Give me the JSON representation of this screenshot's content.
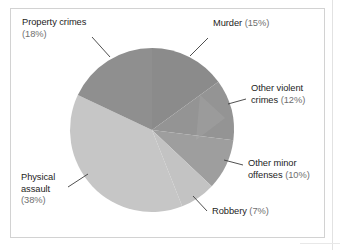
{
  "figure": {
    "background_color": "#ffffff",
    "frame_color": "#d2d2d2"
  },
  "chart_data": {
    "type": "pie",
    "title": "",
    "subtitle": "",
    "xlabel": "",
    "ylabel": "",
    "legend_position": "labels-with-leader-lines",
    "grid": false,
    "units": "percent",
    "start_angle_deg": 0,
    "direction": "clockwise",
    "categories": [
      "Murder",
      "Other violent crimes",
      "Other minor offenses",
      "Robbery",
      "Physical assault",
      "Property crimes"
    ],
    "values": [
      15,
      12,
      10,
      7,
      38,
      18
    ],
    "colors": [
      "#8b8b8b",
      "#949494",
      "#9e9e9e",
      "#c3c3c3",
      "#c6c6c6",
      "#8f8f8f"
    ],
    "slices": [
      {
        "name": "Murder",
        "label": "Murder",
        "percent": 15,
        "percent_text": "(15%)",
        "full_label": "Murder (15%)",
        "color": "#8b8b8b",
        "label_lines": [
          "Murder (15%)"
        ]
      },
      {
        "name": "Other violent crimes",
        "label": "Other violent crimes",
        "percent": 12,
        "percent_text": "(12%)",
        "full_label": "Other violent crimes (12%)",
        "color": "#949494",
        "label_lines": [
          "Other violent",
          "crimes (12%)"
        ]
      },
      {
        "name": "Other minor offenses",
        "label": "Other minor offenses",
        "percent": 10,
        "percent_text": "(10%)",
        "full_label": "Other minor offenses (10%)",
        "color": "#9e9e9e",
        "label_lines": [
          "Other minor",
          "offenses (10%)"
        ]
      },
      {
        "name": "Robbery",
        "label": "Robbery",
        "percent": 7,
        "percent_text": "(7%)",
        "full_label": "Robbery (7%)",
        "color": "#c3c3c3",
        "label_lines": [
          "Robbery (7%)"
        ]
      },
      {
        "name": "Physical assault",
        "label": "Physical assault",
        "percent": 38,
        "percent_text": "(38%)",
        "full_label": "Physical assault (38%)",
        "color": "#c6c6c6",
        "label_lines": [
          "Physical",
          "assault",
          "(38%)"
        ]
      },
      {
        "name": "Property crimes",
        "label": "Property crimes",
        "percent": 18,
        "percent_text": "(18%)",
        "full_label": "Property crimes (18%)",
        "color": "#8f8f8f",
        "label_lines": [
          "Property crimes",
          "(18%)"
        ]
      }
    ]
  },
  "labels": {
    "property_crimes": {
      "line1": "Property crimes",
      "line2": "(18%)"
    },
    "murder": {
      "name": "Murder",
      "pct": "(15%)"
    },
    "other_violent": {
      "line1": "Other violent",
      "line2_name": "crimes",
      "line2_pct": "(12%)"
    },
    "other_minor": {
      "line1": "Other minor",
      "line2_name": "offenses",
      "line2_pct": "(10%)"
    },
    "robbery": {
      "name": "Robbery",
      "pct": "(7%)"
    },
    "physical_assault": {
      "line1": "Physical",
      "line2": "assault",
      "line3": "(38%)"
    }
  }
}
